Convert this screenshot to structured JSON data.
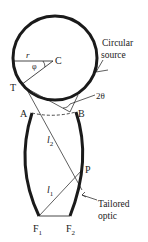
{
  "diagram": {
    "type": "optics-schematic",
    "labels": {
      "center": "C",
      "radius": "r",
      "angle_phi": "φ",
      "tangent_point": "T",
      "angle_2theta": "2θ",
      "point_a": "A",
      "point_b": "B",
      "length_l2": "l",
      "length_l2_sub": "2",
      "point_p": "P",
      "length_l1": "l",
      "length_l1_sub": "1",
      "focus_f1": "F",
      "focus_f1_sub": "1",
      "focus_f2": "F",
      "focus_f2_sub": "2",
      "source_line1": "Circular",
      "source_line2": "source",
      "optic_line1": "Tailored",
      "optic_line2": "optic"
    },
    "colors": {
      "stroke": "#1a1a1a",
      "text": "#222222",
      "background": "#ffffff"
    }
  }
}
